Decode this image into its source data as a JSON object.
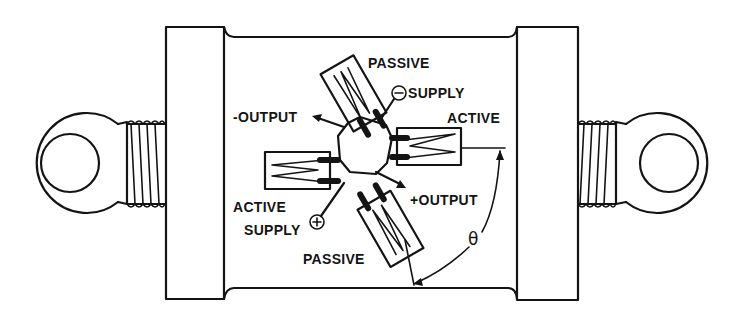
{
  "diagram": {
    "labels": {
      "passive_top": "PASSIVE",
      "supply_neg": "SUPPLY",
      "supply_neg_symbol": "⊖",
      "output_neg": "-OUTPUT",
      "active_right": "ACTIVE",
      "active_left": "ACTIVE",
      "output_pos": "+OUTPUT",
      "supply_pos": "SUPPLY",
      "supply_pos_symbol": "⊕",
      "passive_bottom": "PASSIVE",
      "angle": "θ"
    },
    "components": [
      {
        "name": "left-eye-bolt",
        "type": "eyelet with threaded shank"
      },
      {
        "name": "left-end-cap",
        "type": "cylinder flange"
      },
      {
        "name": "body",
        "type": "cylindrical body"
      },
      {
        "name": "right-end-cap",
        "type": "cylinder flange"
      },
      {
        "name": "right-eye-bolt",
        "type": "eyelet with threaded shank"
      },
      {
        "name": "strain-gauge-active-right",
        "role": "ACTIVE"
      },
      {
        "name": "strain-gauge-active-left",
        "role": "ACTIVE"
      },
      {
        "name": "strain-gauge-passive-top",
        "role": "PASSIVE"
      },
      {
        "name": "strain-gauge-passive-bottom",
        "role": "PASSIVE"
      }
    ],
    "colors": {
      "ink": "#141414",
      "paper": "#ffffff"
    }
  }
}
